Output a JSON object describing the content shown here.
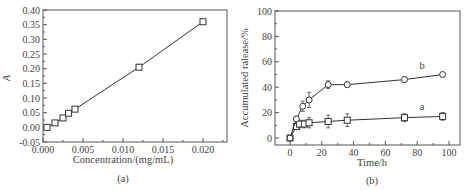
{
  "chart_data": [
    {
      "type": "line",
      "panel_label": "(a)",
      "title": "",
      "xlabel": "Concentration/(mg/mL)",
      "ylabel": "A",
      "xlim": [
        0.0,
        0.023
      ],
      "ylim": [
        -0.05,
        0.4
      ],
      "xticks": [
        "0.000",
        "0.005",
        "0.010",
        "0.015",
        "0.020"
      ],
      "yticks": [
        "-0.05",
        "0.00",
        "0.05",
        "0.10",
        "0.15",
        "0.20",
        "0.25",
        "0.30",
        "0.35",
        "0.40"
      ],
      "grid": false,
      "marker": "square",
      "x": [
        0.0005,
        0.0015,
        0.0025,
        0.0032,
        0.004,
        0.012,
        0.02
      ],
      "values": [
        0.0,
        0.015,
        0.032,
        0.048,
        0.062,
        0.205,
        0.36
      ]
    },
    {
      "type": "line",
      "panel_label": "(b)",
      "title": "",
      "xlabel": "Time/h",
      "ylabel": "Accumulated ralease/%",
      "xlim": [
        -10,
        110
      ],
      "ylim": [
        -5,
        100
      ],
      "xticks": [
        "0",
        "20",
        "40",
        "60",
        "80",
        "100"
      ],
      "yticks": [
        "0",
        "20",
        "40",
        "60",
        "80",
        "100"
      ],
      "grid": false,
      "series": [
        {
          "name": "a",
          "marker": "square",
          "x": [
            0,
            4,
            6,
            9,
            12,
            24,
            36,
            72,
            96
          ],
          "values": [
            0,
            9,
            11,
            11,
            12,
            13,
            14,
            16,
            17
          ],
          "errors": [
            1,
            2,
            3,
            3,
            4,
            5,
            5,
            3,
            3
          ]
        },
        {
          "name": "b",
          "marker": "circle",
          "x": [
            0,
            4,
            8,
            12,
            24,
            36,
            72,
            96
          ],
          "values": [
            0,
            15,
            25,
            30,
            42,
            42,
            46,
            50
          ],
          "errors": [
            1,
            2,
            4,
            6,
            3,
            2,
            2,
            1
          ]
        }
      ],
      "annotations": [
        "a",
        "b"
      ]
    }
  ]
}
